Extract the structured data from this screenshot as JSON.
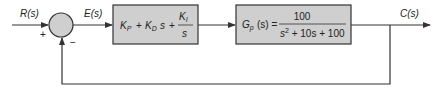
{
  "diagram": {
    "type": "feedback-control-block-diagram",
    "colors": {
      "block_fill": "#cfcfcf",
      "line": "#333333",
      "background": "#ffffff"
    },
    "signals": {
      "input": "R(s)",
      "error": "E(s)",
      "output": "C(s)"
    },
    "summing_junction": {
      "plus_sign": "+",
      "minus_sign": "−"
    },
    "controller": {
      "kp": "K",
      "kp_sub": "P",
      "plus1": "+",
      "kd": "K",
      "kd_sub": "D",
      "kd_s": "s",
      "plus2": "+",
      "ki_num": "K",
      "ki_sub": "I",
      "ki_den": "s"
    },
    "plant": {
      "name": "G",
      "name_sub": "p",
      "arg": "(s) =",
      "numerator": "100",
      "denominator_s": "s",
      "denominator_exp": "2",
      "denominator_rest": " + 10s + 100"
    }
  }
}
